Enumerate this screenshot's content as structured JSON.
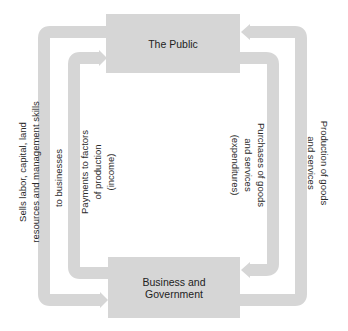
{
  "diagram": {
    "type": "circular-flow",
    "colors": {
      "box_fill": "#d6d6d6",
      "arrow_fill": "#d6d6d6",
      "text": "#222222",
      "background": "#ffffff"
    },
    "nodes": {
      "public": {
        "label": "The Public"
      },
      "business": {
        "label_line1": "Business and",
        "label_line2": "Government"
      }
    },
    "flows": {
      "outer_left": {
        "direction": "public-to-business",
        "line1": "Sells labor, capital, land",
        "line2": "resources and management skills",
        "line3": "to businesses"
      },
      "inner_left": {
        "direction": "business-to-public",
        "line1": "Payments to factors",
        "line2": "of production",
        "line3": "(income)"
      },
      "inner_right": {
        "direction": "public-to-business",
        "line1": "Purchases of goods",
        "line2": "and services",
        "line3": "(expenditures)"
      },
      "outer_right": {
        "direction": "business-to-public",
        "line1": "Production of goods",
        "line2": "and services"
      }
    }
  }
}
